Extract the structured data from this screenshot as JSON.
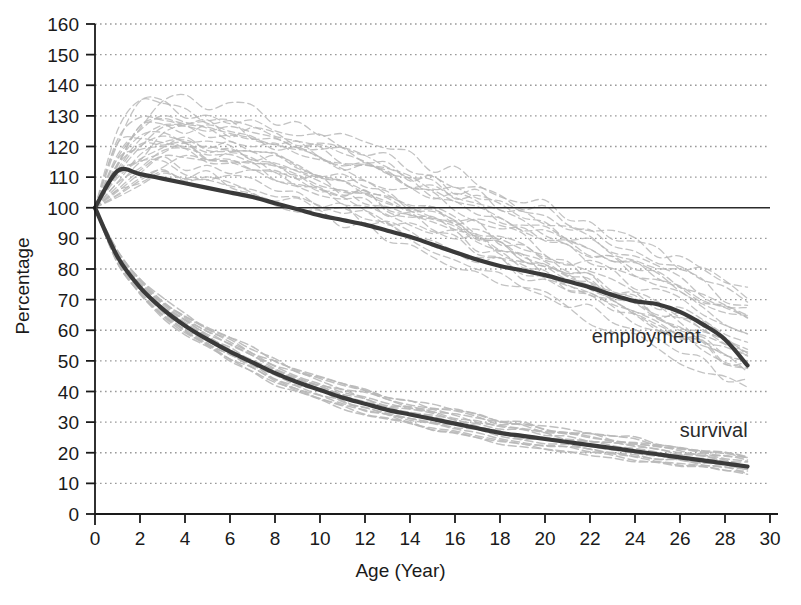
{
  "chart_data": {
    "type": "line",
    "title": "",
    "xlabel": "Age (Year)",
    "ylabel": "Percentage",
    "xlim": [
      0,
      30
    ],
    "ylim": [
      0,
      160
    ],
    "xticks": [
      0,
      2,
      4,
      6,
      8,
      10,
      12,
      14,
      16,
      18,
      20,
      22,
      24,
      26,
      28,
      30
    ],
    "yticks": [
      0,
      10,
      20,
      30,
      40,
      50,
      60,
      70,
      80,
      90,
      100,
      110,
      120,
      130,
      140,
      150,
      160
    ],
    "grid": "horizontal-dotted",
    "legend_position": "inline-annotations",
    "reference_line": {
      "y": 100,
      "label": "100% baseline"
    },
    "x": [
      0,
      1,
      2,
      3,
      4,
      5,
      6,
      7,
      8,
      9,
      10,
      11,
      12,
      13,
      14,
      15,
      16,
      17,
      18,
      19,
      20,
      21,
      22,
      23,
      24,
      25,
      26,
      27,
      28,
      29
    ],
    "series": [
      {
        "name": "employment",
        "color": "#3a3a3a",
        "style": "solid-thick",
        "values": [
          100,
          112,
          111,
          109.5,
          108,
          106.5,
          105,
          103.5,
          101.5,
          99.5,
          97.5,
          96,
          94.5,
          92.5,
          90.5,
          88,
          85.5,
          83,
          81,
          79.5,
          78,
          76,
          74,
          71.5,
          69.5,
          68.5,
          66,
          62,
          57,
          48.5
        ]
      },
      {
        "name": "survival",
        "color": "#3a3a3a",
        "style": "solid-thick",
        "values": [
          100,
          84,
          74,
          67,
          61.5,
          57,
          53,
          49.5,
          46,
          43,
          40.5,
          38,
          36,
          34,
          32.5,
          31,
          29.5,
          28,
          26.5,
          25.5,
          24.5,
          23.5,
          22.5,
          21.5,
          20.5,
          19.5,
          18.5,
          17.5,
          16.5,
          15.5
        ]
      }
    ],
    "cohort_bands": {
      "note": "faint gray dashed individual cohort trajectories, all anchored at 100 at age 0",
      "color": "#b8b8b8",
      "employment_band": {
        "peak_range": [
          112,
          135
        ],
        "peak_age_range": [
          1,
          4
        ],
        "end_range": [
          42,
          72
        ],
        "count": 26
      },
      "survival_band": {
        "end_range": [
          13,
          19
        ],
        "count": 16
      }
    },
    "annotations": [
      {
        "text": "employment",
        "x": 24.5,
        "y": 56
      },
      {
        "text": "survival",
        "x": 27.5,
        "y": 25
      }
    ]
  },
  "axes": {
    "x_title": "Age (Year)",
    "y_title": "Percentage"
  }
}
